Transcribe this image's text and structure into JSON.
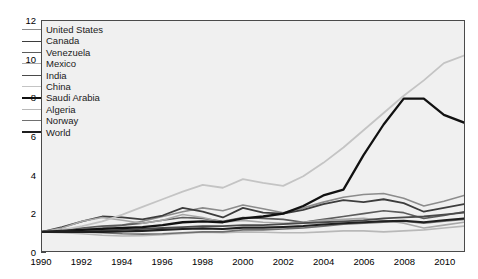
{
  "chart_data": {
    "type": "line",
    "title": "",
    "subtitle": "",
    "xlabel": "",
    "ylabel": "Index (1990=1.0)",
    "xlim": [
      1990,
      2011
    ],
    "ylim": [
      0,
      12
    ],
    "xticks": [
      1990,
      1992,
      1994,
      1996,
      1998,
      2000,
      2002,
      2004,
      2006,
      2008,
      2010
    ],
    "yticks": [
      0,
      2,
      4,
      6,
      8,
      10,
      12
    ],
    "grid": false,
    "legend_position": "upper-left-inside",
    "plot_background": "#f0f0f0",
    "axis_color": "#4a4a4a",
    "x": [
      1990,
      1991,
      1992,
      1993,
      1994,
      1995,
      1996,
      1997,
      1998,
      1999,
      2000,
      2001,
      2002,
      2003,
      2004,
      2005,
      2006,
      2007,
      2008,
      2009,
      2010,
      2011
    ],
    "series": [
      {
        "name": "United States",
        "color": "#8c8c8c",
        "width": 1.6,
        "values": [
          1.0,
          1.05,
          1.12,
          1.2,
          1.35,
          1.55,
          1.8,
          2.05,
          2.25,
          2.1,
          2.4,
          2.2,
          2.0,
          2.25,
          2.55,
          2.8,
          2.95,
          3.0,
          2.75,
          2.35,
          2.6,
          2.9
        ]
      },
      {
        "name": "Canada",
        "color": "#3d3d3d",
        "width": 1.8,
        "values": [
          1.0,
          1.25,
          1.55,
          1.8,
          1.75,
          1.65,
          1.85,
          2.25,
          2.05,
          1.75,
          2.25,
          2.0,
          1.95,
          2.15,
          2.45,
          2.65,
          2.55,
          2.7,
          2.5,
          2.05,
          2.25,
          2.45
        ]
      },
      {
        "name": "Venezuela",
        "color": "#5c5c5c",
        "width": 1.6,
        "values": [
          1.0,
          1.1,
          1.2,
          1.3,
          1.35,
          1.45,
          1.6,
          1.75,
          1.7,
          1.55,
          1.75,
          1.7,
          1.65,
          1.5,
          1.65,
          1.8,
          1.95,
          2.1,
          2.0,
          1.7,
          1.85,
          2.05
        ]
      },
      {
        "name": "Mexico",
        "color": "#a8a8a8",
        "width": 1.6,
        "values": [
          1.0,
          1.2,
          1.55,
          1.75,
          1.6,
          1.45,
          1.6,
          1.9,
          1.75,
          1.5,
          1.6,
          1.5,
          1.45,
          1.5,
          1.6,
          1.65,
          1.7,
          1.6,
          1.45,
          1.2,
          1.35,
          1.5
        ]
      },
      {
        "name": "India",
        "color": "#4a4a4a",
        "width": 1.8,
        "values": [
          1.0,
          1.0,
          1.02,
          1.05,
          1.1,
          1.15,
          1.2,
          1.25,
          1.3,
          1.3,
          1.35,
          1.35,
          1.4,
          1.45,
          1.5,
          1.55,
          1.6,
          1.7,
          1.75,
          1.8,
          1.9,
          2.0
        ]
      },
      {
        "name": "China",
        "color": "#c4c4c4",
        "width": 1.8,
        "values": [
          1.0,
          1.1,
          1.3,
          1.55,
          1.9,
          2.3,
          2.7,
          3.1,
          3.45,
          3.3,
          3.75,
          3.55,
          3.4,
          3.9,
          4.6,
          5.4,
          6.3,
          7.2,
          8.1,
          8.9,
          9.8,
          10.2
        ]
      },
      {
        "name": "Saudi Arabia",
        "color": "#111111",
        "width": 2.3,
        "values": [
          1.0,
          1.05,
          1.1,
          1.15,
          1.2,
          1.25,
          1.35,
          1.5,
          1.55,
          1.5,
          1.7,
          1.8,
          1.95,
          2.35,
          2.9,
          3.2,
          5.0,
          6.6,
          7.95,
          7.95,
          7.1,
          6.7
        ]
      },
      {
        "name": "Algeria",
        "color": "#b8b8b8",
        "width": 1.6,
        "values": [
          1.0,
          0.95,
          0.9,
          0.82,
          0.78,
          0.8,
          0.85,
          0.92,
          0.98,
          0.95,
          1.0,
          0.98,
          0.95,
          0.95,
          1.0,
          1.05,
          1.05,
          1.0,
          1.05,
          1.1,
          1.2,
          1.3
        ]
      },
      {
        "name": "Norway",
        "color": "#707070",
        "width": 1.6,
        "values": [
          1.0,
          1.02,
          1.0,
          0.95,
          0.9,
          0.88,
          0.9,
          0.95,
          1.0,
          1.0,
          1.1,
          1.1,
          1.15,
          1.2,
          1.3,
          1.4,
          1.45,
          1.5,
          1.55,
          1.45,
          1.55,
          1.65
        ]
      },
      {
        "name": "World",
        "color": "#1f1f1f",
        "width": 2.1,
        "values": [
          1.0,
          1.0,
          1.0,
          1.0,
          1.02,
          1.05,
          1.1,
          1.15,
          1.18,
          1.15,
          1.22,
          1.22,
          1.25,
          1.3,
          1.38,
          1.45,
          1.5,
          1.55,
          1.58,
          1.5,
          1.6,
          1.7
        ]
      }
    ]
  },
  "legend": {
    "items": [
      {
        "label": "United States"
      },
      {
        "label": "Canada"
      },
      {
        "label": "Venezuela"
      },
      {
        "label": "Mexico"
      },
      {
        "label": "India"
      },
      {
        "label": "China"
      },
      {
        "label": "Saudi Arabia"
      },
      {
        "label": "Algeria"
      },
      {
        "label": "Norway"
      },
      {
        "label": "World"
      }
    ]
  }
}
